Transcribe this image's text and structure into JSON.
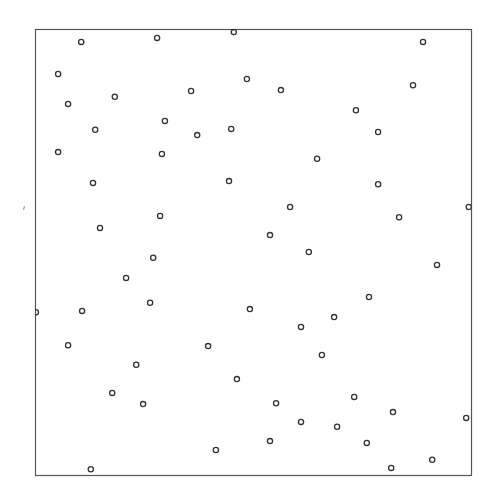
{
  "chart_data": {
    "type": "scatter",
    "title": "",
    "xlabel": "",
    "ylabel": "",
    "xlim": [
      0,
      1
    ],
    "ylim": [
      0,
      1
    ],
    "grid": false,
    "legend": null,
    "axes_ticks_visible": false,
    "marker": "open-circle",
    "marker_color": "#333333",
    "frame_color": "#555555",
    "frame_px": {
      "left": 35,
      "top": 29,
      "right": 471,
      "bottom": 475
    },
    "points": [
      {
        "x": 0.106,
        "y": 0.971
      },
      {
        "x": 0.28,
        "y": 0.98
      },
      {
        "x": 0.456,
        "y": 0.993
      },
      {
        "x": 0.89,
        "y": 0.971
      },
      {
        "x": 0.053,
        "y": 0.899
      },
      {
        "x": 0.486,
        "y": 0.888
      },
      {
        "x": 0.358,
        "y": 0.861
      },
      {
        "x": 0.564,
        "y": 0.863
      },
      {
        "x": 0.867,
        "y": 0.874
      },
      {
        "x": 0.183,
        "y": 0.848
      },
      {
        "x": 0.076,
        "y": 0.832
      },
      {
        "x": 0.736,
        "y": 0.818
      },
      {
        "x": 0.298,
        "y": 0.794
      },
      {
        "x": 0.138,
        "y": 0.774
      },
      {
        "x": 0.45,
        "y": 0.776
      },
      {
        "x": 0.372,
        "y": 0.762
      },
      {
        "x": 0.787,
        "y": 0.769
      },
      {
        "x": 0.053,
        "y": 0.724
      },
      {
        "x": 0.291,
        "y": 0.72
      },
      {
        "x": 0.647,
        "y": 0.709
      },
      {
        "x": 0.133,
        "y": 0.655
      },
      {
        "x": 0.445,
        "y": 0.659
      },
      {
        "x": 0.787,
        "y": 0.652
      },
      {
        "x": 0.585,
        "y": 0.601
      },
      {
        "x": 0.995,
        "y": 0.601
      },
      {
        "x": 0.287,
        "y": 0.581
      },
      {
        "x": 0.835,
        "y": 0.578
      },
      {
        "x": 0.149,
        "y": 0.554
      },
      {
        "x": 0.539,
        "y": 0.538
      },
      {
        "x": 0.628,
        "y": 0.5
      },
      {
        "x": 0.271,
        "y": 0.487
      },
      {
        "x": 0.922,
        "y": 0.471
      },
      {
        "x": 0.209,
        "y": 0.442
      },
      {
        "x": 0.766,
        "y": 0.399
      },
      {
        "x": 0.264,
        "y": 0.386
      },
      {
        "x": 0.493,
        "y": 0.372
      },
      {
        "x": 0.108,
        "y": 0.368
      },
      {
        "x": 0.002,
        "y": 0.365
      },
      {
        "x": 0.686,
        "y": 0.354
      },
      {
        "x": 0.61,
        "y": 0.332
      },
      {
        "x": 0.076,
        "y": 0.291
      },
      {
        "x": 0.397,
        "y": 0.289
      },
      {
        "x": 0.658,
        "y": 0.269
      },
      {
        "x": 0.232,
        "y": 0.247
      },
      {
        "x": 0.463,
        "y": 0.215
      },
      {
        "x": 0.177,
        "y": 0.184
      },
      {
        "x": 0.732,
        "y": 0.175
      },
      {
        "x": 0.248,
        "y": 0.159
      },
      {
        "x": 0.553,
        "y": 0.161
      },
      {
        "x": 0.821,
        "y": 0.141
      },
      {
        "x": 0.989,
        "y": 0.128
      },
      {
        "x": 0.61,
        "y": 0.119
      },
      {
        "x": 0.693,
        "y": 0.108
      },
      {
        "x": 0.539,
        "y": 0.076
      },
      {
        "x": 0.761,
        "y": 0.072
      },
      {
        "x": 0.415,
        "y": 0.056
      },
      {
        "x": 0.911,
        "y": 0.034
      },
      {
        "x": 0.817,
        "y": 0.016
      },
      {
        "x": 0.128,
        "y": 0.013
      }
    ],
    "annotations": [
      {
        "type": "stray-mark",
        "px": {
          "x": 24,
          "y": 208
        }
      }
    ]
  }
}
